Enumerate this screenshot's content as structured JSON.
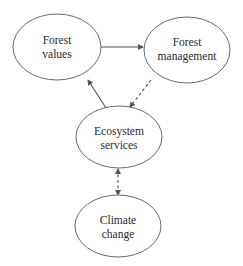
{
  "diagram": {
    "nodes": [
      {
        "id": "forest-values",
        "line1": "Forest",
        "line2": "values",
        "cx": 57,
        "cy": 47,
        "rx": 44,
        "ry": 33
      },
      {
        "id": "forest-management",
        "line1": "Forest",
        "line2": "management",
        "cx": 187,
        "cy": 50,
        "rx": 43,
        "ry": 33
      },
      {
        "id": "ecosystem-services",
        "line1": "Ecosystem",
        "line2": "services",
        "cx": 119,
        "cy": 137,
        "rx": 43,
        "ry": 31
      },
      {
        "id": "climate-change",
        "line1": "Climate",
        "line2": "change",
        "cx": 118,
        "cy": 226,
        "rx": 43,
        "ry": 31
      }
    ],
    "edges": [
      {
        "from": "forest-values",
        "to": "forest-management",
        "style": "solid",
        "direction": "forward"
      },
      {
        "from": "ecosystem-services",
        "to": "forest-values",
        "style": "solid",
        "direction": "forward"
      },
      {
        "from": "forest-management",
        "to": "ecosystem-services",
        "style": "dashed",
        "direction": "forward"
      },
      {
        "from": "ecosystem-services",
        "to": "climate-change",
        "style": "dashed",
        "direction": "both"
      }
    ],
    "colors": {
      "stroke": "#6a6a6a",
      "text": "#2a2a2a",
      "background": "#ffffff"
    }
  }
}
